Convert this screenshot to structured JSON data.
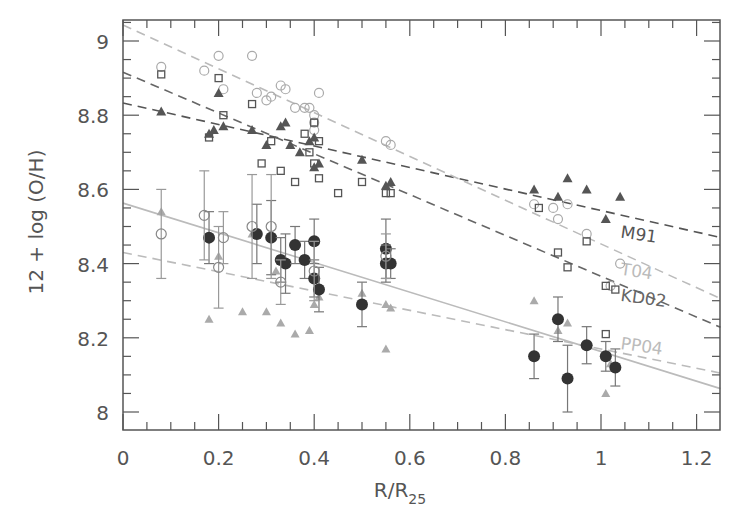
{
  "chart_data": {
    "type": "scatter",
    "title": "",
    "xlabel": "R/R25",
    "xlabel_main": "R/R",
    "xlabel_sub": "25",
    "ylabel": "12 + log (O/H)",
    "xlim": [
      0,
      1.25
    ],
    "ylim": [
      7.95,
      9.05
    ],
    "xticks": [
      0,
      0.2,
      0.4,
      0.6,
      0.8,
      1,
      1.2
    ],
    "xtick_labels": [
      "0",
      "0.2",
      "0.4",
      "0.6",
      "0.8",
      "1",
      "1.2"
    ],
    "yticks": [
      8,
      8.2,
      8.4,
      8.6,
      8.8,
      9
    ],
    "ytick_labels": [
      "8",
      "8.2",
      "8.4",
      "8.6",
      "8.8",
      "9"
    ],
    "grid": false,
    "legend": "none (inline line labels)",
    "colors": {
      "axis": "#555555",
      "dark": "#444444",
      "mid": "#777777",
      "light": "#aaaaaa",
      "faint": "#bbbbbb"
    },
    "fits": [
      {
        "name": "M91",
        "label": "M91",
        "style": "dashed",
        "color": "#555555",
        "intercept": 8.833,
        "slope": -0.29,
        "label_pos": [
          1.04,
          8.47
        ]
      },
      {
        "name": "T04",
        "label": "T04",
        "style": "dashed",
        "color": "#bbbbbb",
        "intercept": 9.043,
        "slope": -0.59,
        "label_pos": [
          1.04,
          8.37
        ]
      },
      {
        "name": "KD02",
        "label": "KD02",
        "style": "dashed",
        "color": "#666666",
        "intercept": 8.916,
        "slope": -0.55,
        "label_pos": [
          1.04,
          8.3
        ]
      },
      {
        "name": "PP04",
        "label": "PP04",
        "style": "dashed",
        "color": "#bbbbbb",
        "intercept": 8.43,
        "slope": -0.26,
        "label_pos": [
          1.04,
          8.17
        ]
      },
      {
        "name": "Te",
        "label": "",
        "style": "solid",
        "color": "#bbbbbb",
        "intercept": 8.563,
        "slope": -0.4
      }
    ],
    "series": [
      {
        "name": "T04",
        "marker": "open-circle",
        "color": "#aaaaaa",
        "points": [
          [
            0.08,
            8.93
          ],
          [
            0.17,
            8.92
          ],
          [
            0.2,
            8.96
          ],
          [
            0.21,
            8.87
          ],
          [
            0.27,
            8.96
          ],
          [
            0.28,
            8.86
          ],
          [
            0.3,
            8.84
          ],
          [
            0.31,
            8.85
          ],
          [
            0.33,
            8.88
          ],
          [
            0.34,
            8.87
          ],
          [
            0.36,
            8.82
          ],
          [
            0.38,
            8.82
          ],
          [
            0.39,
            8.82
          ],
          [
            0.4,
            8.8
          ],
          [
            0.4,
            8.78
          ],
          [
            0.41,
            8.86
          ],
          [
            0.4,
            8.76
          ],
          [
            0.55,
            8.73
          ],
          [
            0.56,
            8.72
          ],
          [
            0.86,
            8.56
          ],
          [
            0.9,
            8.55
          ],
          [
            0.93,
            8.56
          ],
          [
            0.91,
            8.52
          ],
          [
            0.97,
            8.48
          ],
          [
            1.02,
            8.34
          ],
          [
            1.04,
            8.4
          ]
        ]
      },
      {
        "name": "KD02",
        "marker": "open-square",
        "color": "#555555",
        "points": [
          [
            0.08,
            8.91
          ],
          [
            0.18,
            8.74
          ],
          [
            0.2,
            8.9
          ],
          [
            0.21,
            8.8
          ],
          [
            0.27,
            8.83
          ],
          [
            0.29,
            8.67
          ],
          [
            0.31,
            8.73
          ],
          [
            0.33,
            8.65
          ],
          [
            0.36,
            8.62
          ],
          [
            0.38,
            8.75
          ],
          [
            0.39,
            8.7
          ],
          [
            0.4,
            8.78
          ],
          [
            0.4,
            8.67
          ],
          [
            0.41,
            8.63
          ],
          [
            0.41,
            8.73
          ],
          [
            0.45,
            8.59
          ],
          [
            0.5,
            8.62
          ],
          [
            0.55,
            8.59
          ],
          [
            0.56,
            8.59
          ],
          [
            0.87,
            8.55
          ],
          [
            0.91,
            8.43
          ],
          [
            0.93,
            8.39
          ],
          [
            0.97,
            8.46
          ],
          [
            1.01,
            8.34
          ],
          [
            1.03,
            8.33
          ],
          [
            1.01,
            8.21
          ]
        ]
      },
      {
        "name": "M91",
        "marker": "filled-triangle",
        "color": "#555555",
        "points": [
          [
            0.08,
            8.81
          ],
          [
            0.18,
            8.75
          ],
          [
            0.19,
            8.76
          ],
          [
            0.2,
            8.86
          ],
          [
            0.21,
            8.77
          ],
          [
            0.27,
            8.76
          ],
          [
            0.3,
            8.72
          ],
          [
            0.33,
            8.77
          ],
          [
            0.34,
            8.78
          ],
          [
            0.35,
            8.72
          ],
          [
            0.37,
            8.7
          ],
          [
            0.39,
            8.73
          ],
          [
            0.4,
            8.74
          ],
          [
            0.4,
            8.66
          ],
          [
            0.41,
            8.67
          ],
          [
            0.5,
            8.68
          ],
          [
            0.55,
            8.61
          ],
          [
            0.56,
            8.62
          ],
          [
            0.86,
            8.6
          ],
          [
            0.91,
            8.58
          ],
          [
            0.93,
            8.63
          ],
          [
            0.97,
            8.6
          ],
          [
            1.01,
            8.52
          ],
          [
            1.04,
            8.58
          ]
        ]
      },
      {
        "name": "PP04",
        "marker": "light-triangle",
        "color": "#aaaaaa",
        "points": [
          [
            0.08,
            8.54
          ],
          [
            0.18,
            8.25
          ],
          [
            0.2,
            8.42
          ],
          [
            0.25,
            8.27
          ],
          [
            0.27,
            8.48
          ],
          [
            0.3,
            8.27
          ],
          [
            0.32,
            8.38
          ],
          [
            0.33,
            8.24
          ],
          [
            0.36,
            8.21
          ],
          [
            0.39,
            8.22
          ],
          [
            0.4,
            8.29
          ],
          [
            0.41,
            8.31
          ],
          [
            0.5,
            8.32
          ],
          [
            0.55,
            8.17
          ],
          [
            0.55,
            8.29
          ],
          [
            0.56,
            8.28
          ],
          [
            0.86,
            8.3
          ],
          [
            0.91,
            8.22
          ],
          [
            0.93,
            8.24
          ],
          [
            1.01,
            8.05
          ],
          [
            1.02,
            8.13
          ]
        ]
      },
      {
        "name": "Te-direct",
        "marker": "filled-circle",
        "color": "#333333",
        "points": [
          [
            0.18,
            8.47,
            0.07
          ],
          [
            0.28,
            8.48,
            0.08
          ],
          [
            0.31,
            8.47,
            0.1
          ],
          [
            0.33,
            8.41,
            0.06
          ],
          [
            0.34,
            8.4,
            0.08
          ],
          [
            0.36,
            8.45,
            0.05
          ],
          [
            0.38,
            8.41,
            0.05
          ],
          [
            0.4,
            8.46,
            0.06
          ],
          [
            0.4,
            8.36,
            0.05
          ],
          [
            0.41,
            8.33,
            0.06
          ],
          [
            0.5,
            8.29,
            0.06
          ],
          [
            0.55,
            8.44,
            0.08
          ],
          [
            0.55,
            8.4,
            0.05
          ],
          [
            0.56,
            8.4,
            0.04
          ],
          [
            0.86,
            8.15,
            0.06
          ],
          [
            0.91,
            8.25,
            0.06
          ],
          [
            0.93,
            8.09,
            0.09
          ],
          [
            0.97,
            8.18,
            0.05
          ],
          [
            1.01,
            8.15,
            0.04
          ],
          [
            1.03,
            8.12,
            0.05
          ]
        ]
      },
      {
        "name": "Te-other",
        "marker": "open-circle-dark",
        "color": "#888888",
        "points": [
          [
            0.08,
            8.48,
            0.12
          ],
          [
            0.17,
            8.53,
            0.12
          ],
          [
            0.2,
            8.39,
            0.11
          ],
          [
            0.21,
            8.47,
            0.07
          ],
          [
            0.27,
            8.5,
            0.14
          ],
          [
            0.31,
            8.5,
            0.14
          ],
          [
            0.33,
            8.35,
            0.06
          ],
          [
            0.4,
            8.38,
            0.08
          ],
          [
            0.55,
            8.42,
            0.06
          ]
        ]
      }
    ]
  }
}
